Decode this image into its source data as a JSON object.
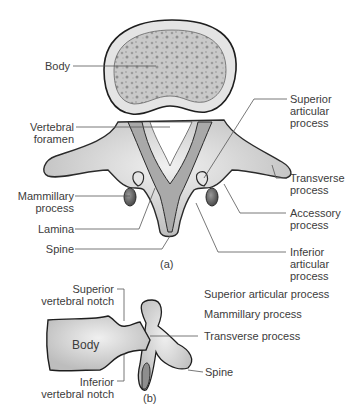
{
  "figure_a": {
    "caption": "(a)",
    "labels": {
      "body": "Body",
      "vertebral_foramen_1": "Vertebral",
      "vertebral_foramen_2": "foramen",
      "mammillary_1": "Mammillary",
      "mammillary_2": "process",
      "lamina": "Lamina",
      "spine": "Spine",
      "superior_articular_1": "Superior",
      "superior_articular_2": "articular",
      "superior_articular_3": "process",
      "transverse_1": "Transverse",
      "transverse_2": "process",
      "accessory_1": "Accessory",
      "accessory_2": "process",
      "inferior_articular_1": "Inferior",
      "inferior_articular_2": "articular",
      "inferior_articular_3": "process"
    }
  },
  "figure_b": {
    "caption": "(b)",
    "labels": {
      "superior_notch_1": "Superior",
      "superior_notch_2": "vertebral notch",
      "body": "Body",
      "inferior_notch_1": "Inferior",
      "inferior_notch_2": "vertebral notch",
      "superior_articular": "Superior articular process",
      "mammillary": "Mammillary process",
      "transverse": "Transverse process",
      "spine": "Spine"
    }
  },
  "colors": {
    "bone_fill": "#d9d9d9",
    "bone_outline": "#2a2a2a",
    "cancellous": "#a8a8a8",
    "dark_process": "#6e6e6e",
    "leader_line": "#555555"
  }
}
